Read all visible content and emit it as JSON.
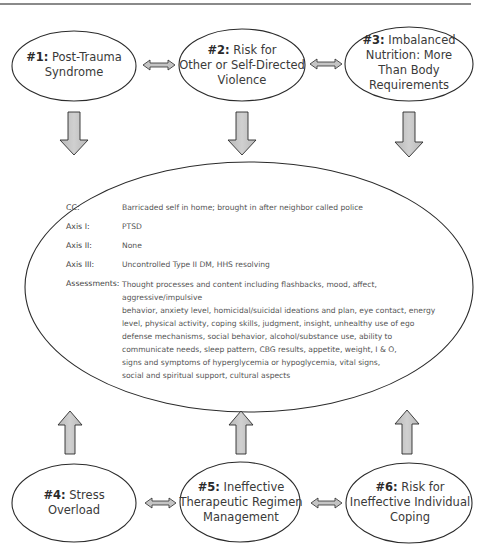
{
  "nodes": {
    "n1": {
      "num": "#1:",
      "title_line1": "Post-Trauma",
      "title_line2": "Syndrome",
      "title_line3": "",
      "title_line4": ""
    },
    "n2": {
      "num": "#2:",
      "title_line1": "Risk for",
      "title_line2": "Other or Self-Directed",
      "title_line3": "Violence",
      "title_line4": ""
    },
    "n3": {
      "num": "#3:",
      "title_line1": "Imbalanced",
      "title_line2": "Nutrition: More",
      "title_line3": "Than Body",
      "title_line4": "Requirements"
    },
    "n4": {
      "num": "#4:",
      "title_line1": "Stress",
      "title_line2": "Overload",
      "title_line3": "",
      "title_line4": ""
    },
    "n5": {
      "num": "#5:",
      "title_line1": "Ineffective",
      "title_line2": "Therapeutic Regimen",
      "title_line3": "Management",
      "title_line4": ""
    },
    "n6": {
      "num": "#6:",
      "title_line1": "Risk for",
      "title_line2": "Ineffective Individual",
      "title_line3": "Coping",
      "title_line4": ""
    }
  },
  "center": {
    "cc": {
      "label": "CC:",
      "value": "Barricaded self in home; brought in after neighbor called police"
    },
    "axis1": {
      "label": "Axis I:",
      "value": "PTSD"
    },
    "axis2": {
      "label": "Axis II:",
      "value": "None"
    },
    "axis3": {
      "label": "Axis III:",
      "value": "Uncontrolled Type II DM, HHS resolving"
    },
    "assessments": {
      "label": "Assessments:",
      "lines": [
        "Thought processes and content including flashbacks, mood, affect, aggressive/impulsive",
        "behavior, anxiety level, homicidal/suicidal ideations and plan, eye contact, energy",
        "level, physical activity, coping skills, judgment, insight, unhealthy use of ego",
        "defense mechanisms, social behavior, alcohol/substance use, ability to",
        "communicate needs, sleep pattern, CBG results, appetite, weight, I & O,",
        "signs and symptoms of hyperglycemia or hypoglycemia, vital signs,",
        "social and spiritual support, cultural aspects"
      ]
    }
  },
  "colors": {
    "arrow_fill": "#c4c4c4",
    "outline": "#2b2b2b",
    "rule": "#8a8a8a"
  }
}
